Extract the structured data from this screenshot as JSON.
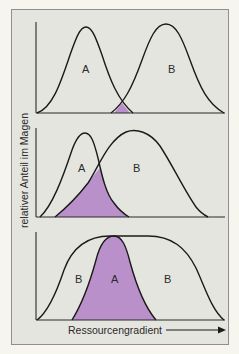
{
  "figure": {
    "ylabel": "relativer Anteil im Magen",
    "xlabel": "Ressourcengradient",
    "overlap_color": "#b990c9",
    "frame_color": "#e5e5e0",
    "page_color": "#f6f5ee"
  },
  "panels": [
    {
      "id": "panel-1",
      "description": "Two separated niches with slight overlap",
      "labels": {
        "a": "A",
        "b": "B"
      }
    },
    {
      "id": "panel-2",
      "description": "Partially overlapping niches",
      "labels": {
        "a": "A",
        "b": "B"
      }
    },
    {
      "id": "panel-3",
      "description": "Niche A nested within broad niche B",
      "labels": {
        "b_left": "B",
        "a": "A",
        "b_right": "B"
      }
    }
  ]
}
